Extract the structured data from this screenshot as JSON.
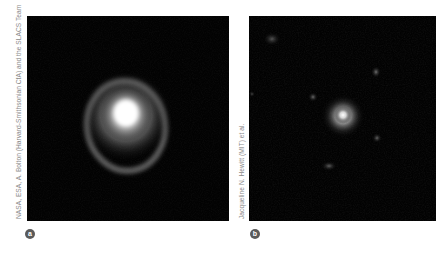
{
  "figure": {
    "panels": [
      {
        "label": "a",
        "credit": "NASA, ESA, A. Bolton (Harvard-Smithsonian CfA) and the SLACS Team",
        "subject": "Einstein ring gravitational lens around bright elliptical galaxy",
        "icon": "galaxy-ring-image"
      },
      {
        "label": "b",
        "credit": "Jacqueline N. Hewitt (MIT) et al.",
        "subject": "compact bright source with faint surrounding field objects",
        "icon": "galaxy-field-image"
      }
    ],
    "colors": {
      "background": "#ffffff",
      "photo_background": "#020202",
      "credit_text": "#8a8a8a",
      "badge": "#5a5a5a"
    }
  }
}
